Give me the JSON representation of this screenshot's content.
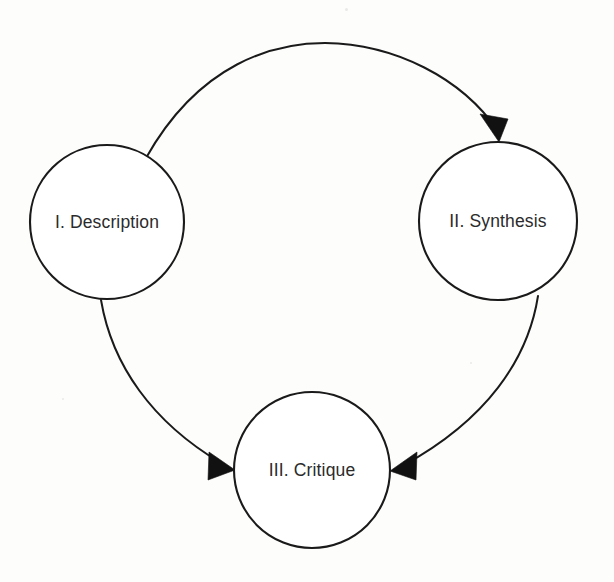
{
  "diagram": {
    "background_color": "#fdfdfc",
    "stroke_color": "#1a1a1a",
    "text_color": "#2b2b2b",
    "nodes": [
      {
        "id": "description",
        "label": "I. Description",
        "cx": 107,
        "cy": 222,
        "r": 77
      },
      {
        "id": "synthesis",
        "label": "II. Synthesis",
        "cx": 498,
        "cy": 221,
        "r": 79
      },
      {
        "id": "critique",
        "label": "III. Critique",
        "cx": 312,
        "cy": 470,
        "r": 78
      }
    ],
    "edges": [
      {
        "id": "description-to-synthesis",
        "from": "I. Description",
        "to": "II. Synthesis",
        "shape": "arc-over-top",
        "arrowhead": "filled-triangle",
        "arrowhead_at": "to"
      },
      {
        "id": "synthesis-to-critique",
        "from": "II. Synthesis",
        "to": "III. Critique",
        "shape": "arc-right-side",
        "arrowhead": "filled-triangle",
        "arrowhead_at": "to"
      },
      {
        "id": "description-to-critique",
        "from": "I. Description",
        "to": "III. Critique",
        "shape": "arc-left-side",
        "arrowhead": "filled-triangle",
        "arrowhead_at": "to"
      }
    ]
  }
}
